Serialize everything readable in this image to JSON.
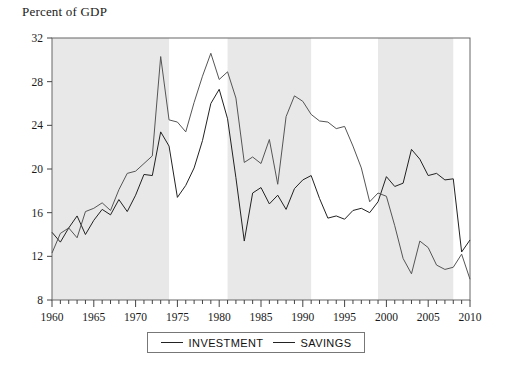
{
  "chart_data": {
    "type": "line",
    "title": "",
    "ylabel": "Percent of GDP",
    "xlabel": "",
    "ylim": [
      8,
      32
    ],
    "xlim": [
      1960,
      2010
    ],
    "y_ticks": [
      8,
      12,
      16,
      20,
      24,
      28,
      32
    ],
    "x_ticks": [
      1960,
      1965,
      1970,
      1975,
      1980,
      1985,
      1990,
      1995,
      2000,
      2005,
      2010
    ],
    "x_minor_tick_step": 1,
    "grid": false,
    "legend_position": "below-center",
    "series": [
      {
        "name": "INVESTMENT",
        "color": "#222222",
        "x": [
          1960,
          1961,
          1962,
          1963,
          1964,
          1965,
          1966,
          1967,
          1968,
          1969,
          1970,
          1971,
          1972,
          1973,
          1974,
          1975,
          1976,
          1977,
          1978,
          1979,
          1980,
          1981,
          1982,
          1983,
          1984,
          1985,
          1986,
          1987,
          1988,
          1989,
          1990,
          1991,
          1992,
          1993,
          1994,
          1995,
          1996,
          1997,
          1998,
          1999,
          2000,
          2001,
          2002,
          2003,
          2004,
          2005,
          2006,
          2007,
          2008,
          2009,
          2010
        ],
        "values": [
          14.2,
          13.3,
          14.6,
          15.7,
          14.0,
          15.3,
          16.3,
          15.8,
          17.2,
          16.1,
          17.6,
          19.5,
          19.4,
          23.4,
          22.1,
          17.4,
          18.5,
          20.1,
          22.6,
          26.0,
          27.3,
          24.6,
          19.2,
          13.4,
          17.8,
          18.3,
          16.8,
          17.6,
          16.3,
          18.2,
          19.0,
          19.4,
          17.3,
          15.5,
          15.7,
          15.4,
          16.2,
          16.4,
          16.0,
          17.0,
          19.3,
          18.4,
          18.7,
          21.8,
          20.9,
          19.4,
          19.6,
          19.0,
          19.1,
          12.4,
          13.5
        ]
      },
      {
        "name": "SAVINGS",
        "color": "#555555",
        "x": [
          1960,
          1961,
          1962,
          1963,
          1964,
          1965,
          1966,
          1967,
          1968,
          1969,
          1970,
          1971,
          1972,
          1973,
          1974,
          1975,
          1976,
          1977,
          1978,
          1979,
          1980,
          1981,
          1982,
          1983,
          1984,
          1985,
          1986,
          1987,
          1988,
          1989,
          1990,
          1991,
          1992,
          1993,
          1994,
          1995,
          1996,
          1997,
          1998,
          1999,
          2000,
          2001,
          2002,
          2003,
          2004,
          2005,
          2006,
          2007,
          2008,
          2009,
          2010
        ],
        "values": [
          12.3,
          14.1,
          14.6,
          13.7,
          16.1,
          16.4,
          16.9,
          16.2,
          18.1,
          19.6,
          19.8,
          20.5,
          21.2,
          30.3,
          24.5,
          24.3,
          23.4,
          26.1,
          28.5,
          30.6,
          28.2,
          28.9,
          26.5,
          20.6,
          21.1,
          20.5,
          22.7,
          18.6,
          24.8,
          26.7,
          26.2,
          25.0,
          24.4,
          24.3,
          23.7,
          23.9,
          22.1,
          20.1,
          17.0,
          17.8,
          17.5,
          14.8,
          11.8,
          10.4,
          13.4,
          12.8,
          11.2,
          10.8,
          11.0,
          12.2,
          9.9
        ]
      }
    ],
    "shaded_bands": [
      {
        "start": 1960,
        "end": 1974,
        "color": "#e8e8e8"
      },
      {
        "start": 1981,
        "end": 1991,
        "color": "#e8e8e8"
      },
      {
        "start": 1999,
        "end": 2008,
        "color": "#e8e8e8"
      }
    ]
  },
  "legend": {
    "items": [
      {
        "label": "INVESTMENT"
      },
      {
        "label": "SAVINGS"
      }
    ]
  }
}
